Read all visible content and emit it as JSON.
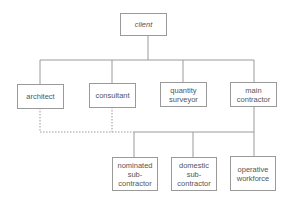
{
  "diagram": {
    "type": "organizational-chart",
    "nodes": [
      {
        "id": "client",
        "label": "client",
        "level": 0
      },
      {
        "id": "architect",
        "label": "architect",
        "level": 1
      },
      {
        "id": "consultant",
        "label": "consultant",
        "level": 1
      },
      {
        "id": "quantity_surveyor",
        "label": "quantity\nsurveyor",
        "level": 1
      },
      {
        "id": "main_contractor",
        "label": "main\ncontractor",
        "level": 1
      },
      {
        "id": "nominated_subcontractor",
        "label": "nominated\nsub-\ncontractor",
        "level": 2
      },
      {
        "id": "domestic_subcontractor",
        "label": "domestic\nsub-\ncontractor",
        "level": 2
      },
      {
        "id": "operative_workforce",
        "label": "operative\nworkforce",
        "level": 2
      }
    ],
    "edges": [
      {
        "from": "client",
        "to": "architect",
        "style": "solid"
      },
      {
        "from": "client",
        "to": "consultant",
        "style": "solid"
      },
      {
        "from": "client",
        "to": "quantity_surveyor",
        "style": "solid"
      },
      {
        "from": "client",
        "to": "main_contractor",
        "style": "solid"
      },
      {
        "from": "main_contractor",
        "to": "nominated_subcontractor",
        "style": "solid"
      },
      {
        "from": "main_contractor",
        "to": "domestic_subcontractor",
        "style": "solid"
      },
      {
        "from": "main_contractor",
        "to": "operative_workforce",
        "style": "solid"
      },
      {
        "from": "architect",
        "to": "subcontractor_line",
        "style": "dashed"
      },
      {
        "from": "consultant",
        "to": "subcontractor_line",
        "style": "dashed"
      }
    ],
    "colors": {
      "line": "#9a9a9a",
      "text": "#555555"
    }
  }
}
